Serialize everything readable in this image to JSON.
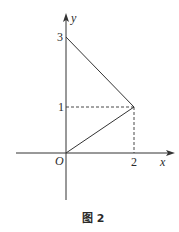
{
  "figure": {
    "caption": "图 2",
    "axes": {
      "x_label": "x",
      "y_label": "y",
      "origin_label": "O"
    },
    "ticks": {
      "y_3": "3",
      "y_1": "1",
      "x_2": "2"
    },
    "points": [
      {
        "name": "A",
        "x": 0,
        "y": 3
      },
      {
        "name": "B",
        "x": 2,
        "y": 1
      },
      {
        "name": "O",
        "x": 0,
        "y": 0
      }
    ],
    "segments": [
      {
        "from": [
          0,
          3
        ],
        "to": [
          2,
          1
        ],
        "style": "solid"
      },
      {
        "from": [
          0,
          0
        ],
        "to": [
          2,
          1
        ],
        "style": "solid"
      },
      {
        "from": [
          0,
          1
        ],
        "to": [
          2,
          1
        ],
        "style": "dashed"
      },
      {
        "from": [
          2,
          0
        ],
        "to": [
          2,
          1
        ],
        "style": "dashed"
      }
    ],
    "colors": {
      "line": "#333333",
      "background": "#ffffff"
    }
  }
}
